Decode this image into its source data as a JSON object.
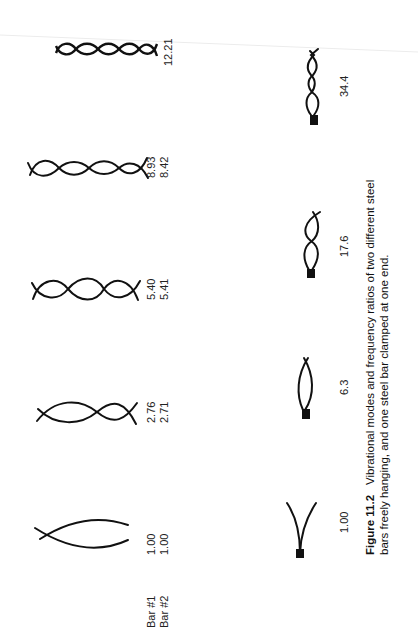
{
  "figure": {
    "number": "Figure 11.2",
    "caption_line1": "Vibrational modes and frequency ratios of two different steel",
    "caption_line2": "bars freely hanging, and one steel bar clamped at one end."
  },
  "free_bars": {
    "row_labels": [
      "Bar #1",
      "Bar #2"
    ],
    "modes": [
      {
        "mode": 1,
        "bar1": "1.00",
        "bar2": "1.00"
      },
      {
        "mode": 2,
        "bar1": "2.76",
        "bar2": "2.71"
      },
      {
        "mode": 3,
        "bar1": "5.40",
        "bar2": "5.41"
      },
      {
        "mode": 4,
        "bar1": "8.93",
        "bar2": "8.42"
      },
      {
        "mode": 5,
        "bar1": "12.21",
        "bar2": ""
      }
    ]
  },
  "clamped_bar": {
    "modes": [
      {
        "mode": 1,
        "ratio": "1.00"
      },
      {
        "mode": 2,
        "ratio": "6.3"
      },
      {
        "mode": 3,
        "ratio": "17.6"
      },
      {
        "mode": 4,
        "ratio": "34.4"
      }
    ]
  },
  "colors": {
    "ink": "#111111",
    "background": "#ffffff"
  }
}
